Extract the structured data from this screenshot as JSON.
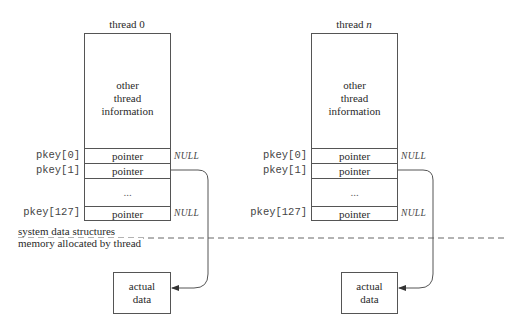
{
  "threads": [
    {
      "title_prefix": "thread ",
      "title_index": "0",
      "info_lines": [
        "other",
        "thread",
        "information"
      ],
      "slots": [
        {
          "key": "pkey[0]",
          "value": "pointer",
          "target": "NULL"
        },
        {
          "key": "pkey[1]",
          "value": "pointer",
          "target": "actual data"
        },
        {
          "key": "",
          "value": "...",
          "target": ""
        },
        {
          "key": "pkey[127]",
          "value": "pointer",
          "target": "NULL"
        }
      ],
      "data_box": {
        "line1": "actual",
        "line2": "data"
      }
    },
    {
      "title_prefix": "thread ",
      "title_index": "n",
      "info_lines": [
        "other",
        "thread",
        "information"
      ],
      "slots": [
        {
          "key": "pkey[0]",
          "value": "pointer",
          "target": "NULL"
        },
        {
          "key": "pkey[1]",
          "value": "pointer",
          "target": "actual data"
        },
        {
          "key": "",
          "value": "...",
          "target": ""
        },
        {
          "key": "pkey[127]",
          "value": "pointer",
          "target": "NULL"
        }
      ],
      "data_box": {
        "line1": "actual",
        "line2": "data"
      }
    }
  ],
  "null_label": "NULL",
  "divider": {
    "above_label": "system data structures",
    "below_label": "memory allocated by thread"
  },
  "colors": {
    "line": "#555555",
    "text": "#2a2a2a",
    "background": "#ffffff"
  }
}
